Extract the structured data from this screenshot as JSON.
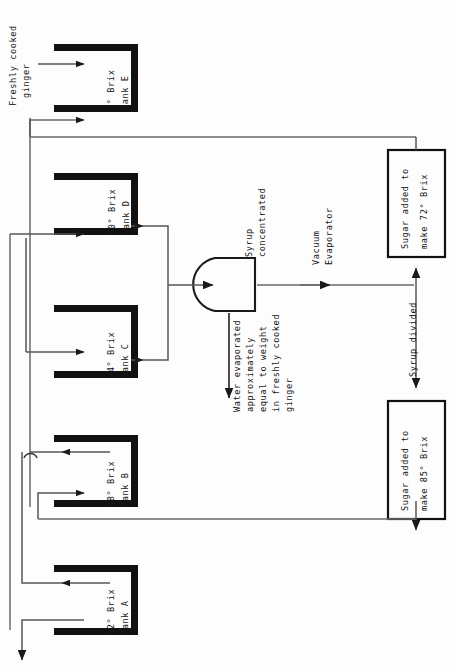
{
  "diagram": {
    "orientation": "rotated-90",
    "colors": {
      "ink": "#141414",
      "pipe": "#4f4f4f",
      "tank_wall": "#111111",
      "background": "#fdfdfd"
    },
    "input_label": "Freshly cooked\nginger",
    "tanks": [
      {
        "id": "E",
        "name": "Tank E",
        "brix": "0",
        "brix_label": "0° Brix"
      },
      {
        "id": "D",
        "name": "Tank D",
        "brix": "30",
        "brix_label": "30° Brix"
      },
      {
        "id": "C",
        "name": "Tank C",
        "brix": "44",
        "brix_label": "44° Brix"
      },
      {
        "id": "B",
        "name": "Tank B",
        "brix": "58",
        "brix_label": "58° Brix"
      },
      {
        "id": "A",
        "name": "Tank A",
        "brix": "72",
        "brix_label": "72° Brix"
      }
    ],
    "evaporator": {
      "name": "Vacuum Evaporator",
      "inlet_label": "Syrup\nconcentrated",
      "vent_label": "Water evaporated\napproximately\nequal to weight\nin freshly cooked\nginger"
    },
    "split_label": "Syrup divided",
    "boxes": [
      {
        "id": "box72",
        "line1": "Sugar added to",
        "line2": "make 72° Brix",
        "brix": "72"
      },
      {
        "id": "box85",
        "line1": "Sugar added to",
        "line2": "make 85° Brix",
        "brix": "85"
      }
    ],
    "labels": {
      "brix_unit": "Brix",
      "degree": "°"
    }
  }
}
